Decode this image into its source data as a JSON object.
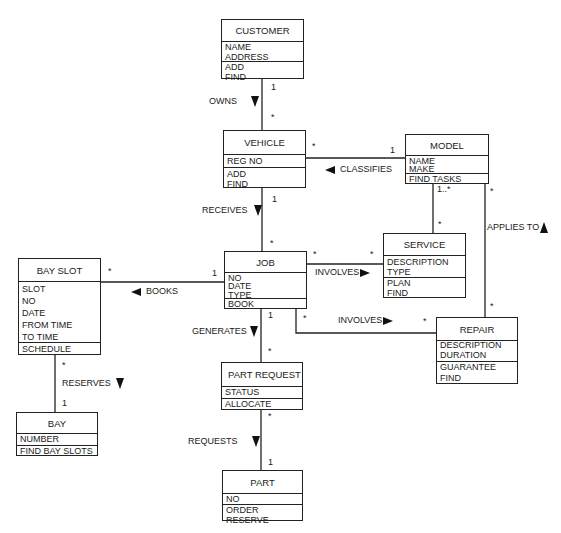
{
  "classes": {
    "customer": {
      "name": "CUSTOMER",
      "attributes": [
        "NAME",
        "ADDRESS"
      ],
      "operations": [
        "ADD",
        "FIND"
      ]
    },
    "vehicle": {
      "name": "VEHICLE",
      "attributes": [
        "REG NO"
      ],
      "operations": [
        "ADD",
        "FIND"
      ]
    },
    "model": {
      "name": "MODEL",
      "attributes": [
        "NAME",
        "MAKE"
      ],
      "operations": [
        "FIND TASKS"
      ]
    },
    "job": {
      "name": "JOB",
      "attributes": [
        "NO",
        "DATE",
        "TYPE"
      ],
      "operations": [
        "BOOK"
      ]
    },
    "service": {
      "name": "SERVICE",
      "attributes": [
        "DESCRIPTION",
        "TYPE"
      ],
      "operations": [
        "PLAN",
        "FIND"
      ]
    },
    "bay_slot": {
      "name": "BAY SLOT",
      "attributes": [
        "SLOT",
        "NO",
        "DATE",
        "FROM TIME",
        "TO TIME"
      ],
      "operations": [
        "SCHEDULE"
      ]
    },
    "repair": {
      "name": "REPAIR",
      "attributes": [
        "DESCRIPTION",
        "DURATION"
      ],
      "operations": [
        "GUARANTEE",
        "FIND"
      ]
    },
    "part_request": {
      "name": "PART REQUEST",
      "attributes": [
        "STATUS"
      ],
      "operations": [
        "ALLOCATE"
      ]
    },
    "bay": {
      "name": "BAY",
      "attributes": [
        "NUMBER"
      ],
      "operations": [
        "FIND BAY SLOTS"
      ]
    },
    "part": {
      "name": "PART",
      "attributes": [
        "NO"
      ],
      "operations": [
        "ORDER",
        "RESERVE"
      ]
    }
  },
  "associations": {
    "owns": {
      "label": "OWNS",
      "direction": "down",
      "mult_from": "1",
      "mult_to": "*"
    },
    "classifies": {
      "label": "CLASSIFIES",
      "direction": "left",
      "mult_from": "1",
      "mult_to": "*"
    },
    "receives": {
      "label": "RECEIVES",
      "direction": "down",
      "mult_from": "1",
      "mult_to": "*"
    },
    "model_service": {
      "mult_from": "1..*",
      "mult_to": "*"
    },
    "applies_to": {
      "label": "APPLIES TO",
      "direction": "up",
      "mult_from": "*",
      "mult_to": "*"
    },
    "books": {
      "label": "BOOKS",
      "direction": "left",
      "mult_from": "1",
      "mult_to": "*"
    },
    "involves_service": {
      "label": "INVOLVES",
      "direction": "right",
      "mult_from": "*",
      "mult_to": "*"
    },
    "involves_repair": {
      "label": "INVOLVES",
      "direction": "right",
      "mult_from": "*",
      "mult_to": "*"
    },
    "generates": {
      "label": "GENERATES",
      "direction": "down",
      "mult_from": "1",
      "mult_to": "*"
    },
    "reserves": {
      "label": "RESERVES",
      "direction": "down",
      "mult_from": "*",
      "mult_to": "1"
    },
    "requests": {
      "label": "REQUESTS",
      "direction": "down",
      "mult_from": "*",
      "mult_to": "1"
    }
  }
}
